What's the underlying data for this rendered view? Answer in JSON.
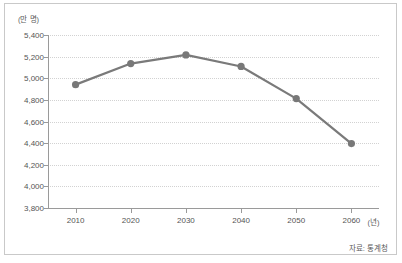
{
  "chart_data": {
    "type": "line",
    "title": "",
    "subtitle": "",
    "xlabel": "",
    "ylabel": "",
    "y_unit_label": "(만 명)",
    "x_unit_label": "(년)",
    "categories": [
      "2010",
      "2020",
      "2030",
      "2040",
      "2050",
      "2060"
    ],
    "x": [
      2010,
      2020,
      2030,
      2040,
      2050,
      2060
    ],
    "values": [
      4941,
      5136,
      5216,
      5109,
      4812,
      4396
    ],
    "series": [
      {
        "name": "총인구",
        "values": [
          4941,
          5136,
          5216,
          5109,
          4812,
          4396
        ]
      }
    ],
    "ylim": [
      3800,
      5400
    ],
    "ytick_step": 200,
    "yticks": [
      5400,
      5200,
      5000,
      4800,
      4600,
      4400,
      4200,
      4000,
      3800
    ],
    "ytick_labels": [
      "5,400",
      "5,200",
      "5,000",
      "4,800",
      "4,600",
      "4,400",
      "4,200",
      "4,000",
      "3,800"
    ],
    "xlim": [
      2005,
      2065
    ],
    "grid": true,
    "grid_style": "dotted-horizontal",
    "legend": false,
    "legend_position": "none",
    "line_color": "#7a7a7a",
    "marker_color": "#787878",
    "marker_shape": "circle",
    "grid_color": "#d2d2d2",
    "axis_color": "#9a9a9a",
    "text_color": "#555555",
    "background_color": "#ffffff"
  },
  "footer": {
    "source_note": "자료: 통계청"
  }
}
